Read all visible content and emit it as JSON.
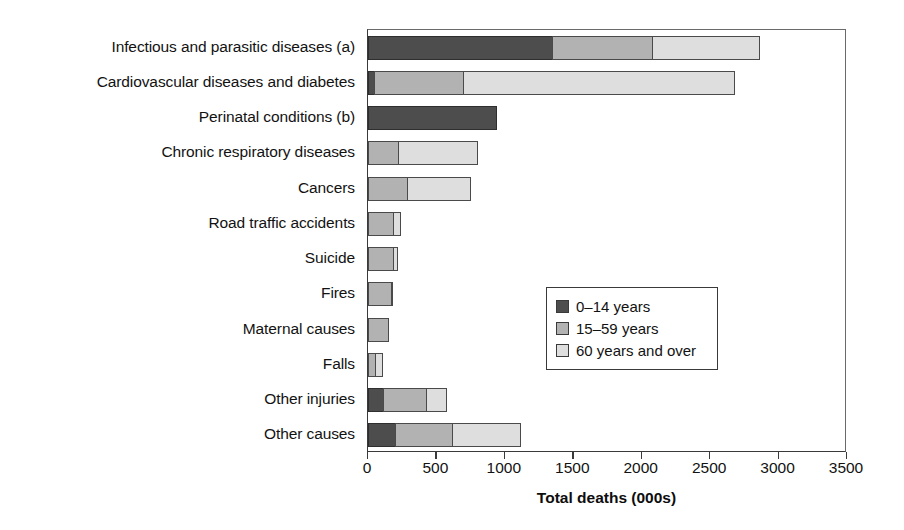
{
  "chart_data": {
    "type": "bar",
    "orientation": "horizontal",
    "stacked": true,
    "title": "",
    "xlabel": "Total deaths (000s)",
    "ylabel": "",
    "xlim": [
      0,
      3500
    ],
    "xticks": [
      0,
      500,
      1000,
      1500,
      2000,
      2500,
      3000,
      3500
    ],
    "xtick_labels": [
      "0",
      "500",
      "1000",
      "1500",
      "2000",
      "2500",
      "3000",
      "3500"
    ],
    "grid": false,
    "legend_position": "center-right-inside",
    "categories": [
      "Infectious and parasitic diseases (a)",
      "Cardiovascular diseases and diabetes",
      "Perinatal conditions (b)",
      "Chronic respiratory diseases",
      "Cancers",
      "Road traffic accidents",
      "Suicide",
      "Fires",
      "Maternal causes",
      "Falls",
      "Other injuries",
      "Other causes"
    ],
    "series": [
      {
        "name": "0–14 years",
        "color": "#4d4d4d",
        "values": [
          1350,
          50,
          940,
          0,
          0,
          0,
          0,
          0,
          0,
          0,
          115,
          205
        ]
      },
      {
        "name": "15–59 years",
        "color": "#b2b2b2",
        "values": [
          740,
          660,
          0,
          230,
          290,
          190,
          190,
          175,
          150,
          60,
          320,
          425
        ]
      },
      {
        "name": "60 years and over",
        "color": "#dedede",
        "values": [
          790,
          1990,
          0,
          580,
          470,
          55,
          35,
          15,
          0,
          55,
          155,
          505
        ]
      }
    ],
    "totals": [
      2880,
      2700,
      940,
      810,
      760,
      245,
      225,
      190,
      150,
      115,
      590,
      1135
    ],
    "legend_entries": [
      "0–14 years",
      "15–59 years",
      "60 years and over"
    ]
  }
}
